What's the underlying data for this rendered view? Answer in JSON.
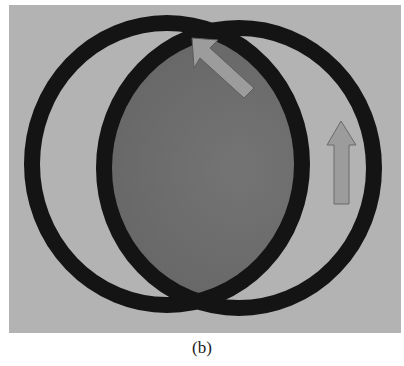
{
  "figure": {
    "caption": "(b)",
    "colors": {
      "frame_background": "#b3b3b3",
      "lens_fill": "#707070",
      "ring": "#141414",
      "arrow_fill": "#9c9c9c",
      "arrow_stroke": "#5c5c5c",
      "page_background": "#ffffff"
    },
    "frame": {
      "x": 9,
      "y": 5,
      "width": 392,
      "height": 328
    },
    "rings": [
      {
        "name": "left-ring",
        "cx": 167,
        "cy": 164,
        "rx": 135,
        "ry": 141,
        "stroke_width": 16
      },
      {
        "name": "right-ring",
        "cx": 239,
        "cy": 168,
        "rx": 135,
        "ry": 140,
        "stroke_width": 16
      }
    ],
    "arrows": [
      {
        "name": "diagonal-arrow",
        "direction": "up-left",
        "points": "192,38 218,40 210,48 254,88 244,98 200,58 194,68"
      },
      {
        "name": "vertical-arrow",
        "direction": "up",
        "points": "341,121 356,145 349,145 349,204 334,204 334,145 327,145"
      }
    ]
  }
}
